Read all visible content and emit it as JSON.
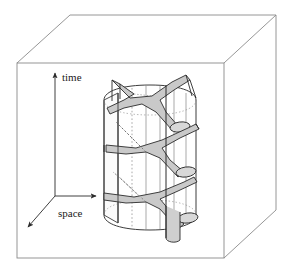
{
  "figure": {
    "kind": "3d-diagram",
    "title_visible": false,
    "background_color": "#ffffff",
    "line_color": "#3c3c3c",
    "outline_color": "#1a1a1a",
    "surface_fill": "#c9c9c9",
    "surface_fill_light": "#d8d8d8",
    "dotted_color": "#555555",
    "box": {
      "name": "ambient-spacetime-box",
      "front_top_left": [
        17,
        63
      ],
      "front_top_right": [
        224,
        63
      ],
      "front_bottom_left": [
        17,
        258
      ],
      "front_bottom_right": [
        224,
        258
      ],
      "back_top_left": [
        70,
        15
      ],
      "back_top_right": [
        276,
        15
      ],
      "back_bottom_right": [
        276,
        210
      ]
    },
    "axes": {
      "origin": [
        55,
        196
      ],
      "items": [
        {
          "name": "time-axis",
          "label": "time",
          "direction": "up",
          "tip": [
            55,
            71
          ],
          "label_pos": [
            62,
            77
          ]
        },
        {
          "name": "space-axis",
          "label": "space",
          "direction": "right",
          "tip": [
            98,
            196
          ],
          "label_pos": [
            58,
            213
          ]
        },
        {
          "name": "depth-axis",
          "label": "",
          "direction": "down-left",
          "tip": [
            26,
            229
          ],
          "label_pos": [
            0,
            0
          ]
        }
      ]
    },
    "worldsheet": {
      "name": "string-worldsheet-cylinder",
      "description": "cylindrical worldsheet with vertical ruling lines and three trivalent interaction vertices",
      "ruling_line_count": 7,
      "vertex_levels": [
        105,
        150,
        196
      ],
      "cross_sections": 3
    }
  },
  "labels": {
    "time": "time",
    "space": "space"
  }
}
